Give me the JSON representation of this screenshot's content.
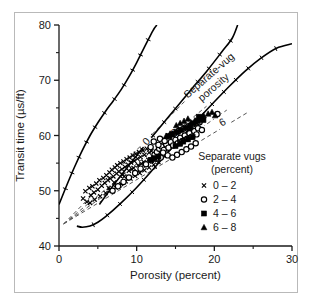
{
  "chart_data": {
    "type": "scatter",
    "title": "",
    "xlabel": "Porosity (percent)",
    "ylabel": "Transit time (µs/ft)",
    "xlim": [
      0,
      30
    ],
    "ylim": [
      40,
      80
    ],
    "xticks": [
      0,
      10,
      20,
      30
    ],
    "yticks": [
      40,
      50,
      60,
      70,
      80
    ],
    "xtick_labels": [
      "0",
      "10",
      "20",
      "30"
    ],
    "ytick_labels": [
      "40",
      "50",
      "60",
      "70",
      "80"
    ],
    "yminor_ticks": [
      45,
      55,
      65,
      75
    ],
    "xminor_ticks": [
      5,
      15,
      25
    ],
    "grid": false,
    "annotation": "Separate-vug porosity",
    "annotation_line1": "Separate-vug",
    "annotation_line2": "porosity",
    "contour_labels": [
      "0",
      "2",
      "4",
      "6"
    ],
    "legend": {
      "title_line1": "Separate vugs",
      "title_line2": "(percent)",
      "position": "lower-right",
      "entries": [
        {
          "marker": "cross",
          "label": "0 – 2"
        },
        {
          "marker": "circle",
          "label": "2 – 4"
        },
        {
          "marker": "square",
          "label": "4 – 6"
        },
        {
          "marker": "triangle",
          "label": "6 – 8"
        }
      ]
    },
    "boundary_curves": [
      {
        "name": "upper-left-bound",
        "points": [
          [
            0,
            47.5
          ],
          [
            1,
            51.0
          ],
          [
            2,
            54.3
          ],
          [
            3,
            57.3
          ],
          [
            4,
            60.0
          ],
          [
            5,
            62.3
          ],
          [
            6,
            64.4
          ],
          [
            7,
            66.3
          ],
          [
            8,
            68.3
          ],
          [
            9,
            70.6
          ],
          [
            10,
            73.2
          ],
          [
            11,
            76.0
          ],
          [
            12.1,
            79.0
          ],
          [
            12.6,
            80.0
          ]
        ]
      },
      {
        "name": "middle-bound",
        "points": [
          [
            5.2,
            47.5
          ],
          [
            7,
            51.0
          ],
          [
            9,
            54.6
          ],
          [
            11,
            58.1
          ],
          [
            13,
            61.5
          ],
          [
            15,
            64.9
          ],
          [
            17,
            68.3
          ],
          [
            19,
            71.6
          ],
          [
            21,
            75.2
          ],
          [
            22.3,
            77.6
          ],
          [
            23.0,
            80.0
          ]
        ]
      },
      {
        "name": "lower-right-bound",
        "points": [
          [
            2.3,
            43.6
          ],
          [
            3,
            43.4
          ],
          [
            4,
            43.6
          ],
          [
            5,
            44.3
          ],
          [
            6,
            45.3
          ],
          [
            8,
            47.8
          ],
          [
            10,
            50.6
          ],
          [
            12,
            53.7
          ],
          [
            14,
            56.9
          ],
          [
            16,
            60.0
          ],
          [
            18,
            63.1
          ],
          [
            20,
            66.1
          ],
          [
            22,
            69.0
          ],
          [
            24,
            71.7
          ],
          [
            26,
            74.0
          ],
          [
            28,
            75.8
          ],
          [
            30,
            76.6
          ]
        ]
      }
    ],
    "contour_lines": [
      {
        "label": "0",
        "points": [
          [
            0.6,
            44.0
          ],
          [
            16.2,
            66.2
          ]
        ],
        "label_at": [
          11.2,
          59.0
        ]
      },
      {
        "label": "2",
        "points": [
          [
            0.6,
            44.0
          ],
          [
            19.0,
            65.3
          ]
        ],
        "label_at": [
          14.8,
          60.6
        ]
      },
      {
        "label": "4",
        "points": [
          [
            0.6,
            44.0
          ],
          [
            21.6,
            64.6
          ]
        ],
        "label_at": [
          17.9,
          61.6
        ]
      },
      {
        "label": "6",
        "points": [
          [
            0.6,
            44.0
          ],
          [
            24.2,
            64.1
          ]
        ],
        "label_at": [
          21.0,
          62.5
        ]
      }
    ],
    "series": [
      {
        "name": "0 – 2",
        "marker": "cross",
        "points": [
          [
            3.1,
            48.6
          ],
          [
            3.4,
            49.9
          ],
          [
            3.6,
            48.0
          ],
          [
            3.9,
            50.5
          ],
          [
            4.1,
            49.2
          ],
          [
            4.3,
            50.8
          ],
          [
            4.5,
            49.7
          ],
          [
            4.8,
            51.3
          ],
          [
            5.0,
            50.2
          ],
          [
            5.2,
            51.9
          ],
          [
            5.5,
            50.9
          ],
          [
            5.7,
            52.3
          ],
          [
            5.9,
            51.4
          ],
          [
            6.1,
            52.8
          ],
          [
            6.3,
            51.9
          ],
          [
            6.5,
            53.3
          ],
          [
            6.6,
            52.2
          ],
          [
            6.8,
            53.8
          ],
          [
            7.0,
            52.6
          ],
          [
            7.2,
            54.2
          ],
          [
            7.4,
            53.1
          ],
          [
            7.5,
            54.6
          ],
          [
            7.7,
            53.5
          ],
          [
            7.9,
            55.0
          ],
          [
            8.1,
            53.9
          ],
          [
            8.3,
            55.3
          ],
          [
            8.5,
            54.3
          ],
          [
            8.7,
            55.7
          ],
          [
            8.9,
            54.7
          ],
          [
            9.1,
            56.0
          ],
          [
            9.3,
            55.1
          ],
          [
            9.5,
            56.4
          ],
          [
            9.7,
            55.4
          ],
          [
            9.9,
            56.7
          ],
          [
            10.1,
            55.8
          ],
          [
            10.3,
            57.0
          ],
          [
            10.5,
            56.1
          ],
          [
            10.8,
            57.3
          ],
          [
            11.0,
            56.5
          ],
          [
            11.3,
            57.6
          ],
          [
            11.6,
            56.9
          ],
          [
            11.9,
            57.2
          ],
          [
            4.0,
            47.8
          ],
          [
            4.6,
            48.4
          ],
          [
            5.3,
            49.0
          ],
          [
            6.0,
            49.6
          ],
          [
            6.7,
            50.1
          ],
          [
            7.3,
            50.6
          ],
          [
            8.0,
            51.2
          ],
          [
            8.6,
            51.7
          ],
          [
            9.2,
            52.2
          ],
          [
            9.8,
            52.7
          ],
          [
            10.4,
            53.2
          ],
          [
            11.0,
            53.7
          ],
          [
            11.6,
            54.2
          ],
          [
            12.2,
            54.7
          ],
          [
            12.8,
            55.2
          ],
          [
            7.8,
            51.0
          ],
          [
            8.4,
            52.6
          ],
          [
            9.0,
            53.6
          ],
          [
            9.6,
            54.1
          ],
          [
            10.2,
            54.6
          ],
          [
            10.9,
            55.2
          ],
          [
            11.5,
            55.6
          ],
          [
            12.1,
            56.0
          ],
          [
            6.4,
            50.5
          ],
          [
            7.1,
            51.5
          ],
          [
            8.2,
            52.9
          ],
          [
            9.4,
            53.9
          ],
          [
            10.6,
            54.9
          ]
        ]
      },
      {
        "name": "2 – 4",
        "marker": "circle",
        "points": [
          [
            6.9,
            50.0
          ],
          [
            7.6,
            50.8
          ],
          [
            8.3,
            51.6
          ],
          [
            9.0,
            52.4
          ],
          [
            9.8,
            53.2
          ],
          [
            10.5,
            54.0
          ],
          [
            11.2,
            54.8
          ],
          [
            11.9,
            55.5
          ],
          [
            12.3,
            56.5
          ],
          [
            12.6,
            57.0
          ],
          [
            12.9,
            57.6
          ],
          [
            13.2,
            58.0
          ],
          [
            13.5,
            57.4
          ],
          [
            13.8,
            58.4
          ],
          [
            14.1,
            57.8
          ],
          [
            14.4,
            58.8
          ],
          [
            14.7,
            58.2
          ],
          [
            15.0,
            59.2
          ],
          [
            15.3,
            58.6
          ],
          [
            15.6,
            59.6
          ],
          [
            15.9,
            59.0
          ],
          [
            16.2,
            60.0
          ],
          [
            16.5,
            59.4
          ],
          [
            16.8,
            60.4
          ],
          [
            17.1,
            59.8
          ],
          [
            17.4,
            60.8
          ],
          [
            17.7,
            60.2
          ],
          [
            12.2,
            58.9
          ],
          [
            12.8,
            58.3
          ],
          [
            13.4,
            56.9
          ],
          [
            14.0,
            56.4
          ],
          [
            14.6,
            56.0
          ],
          [
            15.2,
            56.5
          ],
          [
            15.8,
            57.0
          ],
          [
            16.4,
            57.5
          ],
          [
            17.0,
            58.0
          ],
          [
            17.6,
            58.6
          ],
          [
            13.0,
            59.4
          ],
          [
            13.6,
            59.0
          ],
          [
            14.2,
            59.8
          ],
          [
            14.8,
            60.3
          ],
          [
            15.4,
            60.8
          ],
          [
            16.0,
            61.2
          ],
          [
            16.6,
            61.6
          ],
          [
            17.2,
            62.0
          ],
          [
            17.9,
            61.3
          ],
          [
            18.4,
            61.0
          ],
          [
            13.1,
            56.0
          ],
          [
            11.8,
            57.9
          ],
          [
            12.5,
            55.8
          ],
          [
            18.1,
            62.4
          ],
          [
            20.4,
            63.9
          ]
        ]
      },
      {
        "name": "4 – 6",
        "marker": "square",
        "points": [
          [
            11.8,
            55.6
          ],
          [
            12.3,
            55.9
          ],
          [
            12.8,
            56.2
          ],
          [
            14.1,
            59.9
          ],
          [
            14.6,
            60.2
          ],
          [
            15.2,
            60.6
          ],
          [
            15.7,
            61.0
          ],
          [
            16.3,
            61.4
          ],
          [
            16.9,
            61.8
          ],
          [
            17.4,
            62.2
          ],
          [
            17.9,
            62.6
          ],
          [
            18.3,
            63.0
          ],
          [
            16.0,
            58.9
          ],
          [
            16.6,
            59.3
          ],
          [
            17.2,
            59.7
          ],
          [
            15.0,
            58.1
          ],
          [
            15.6,
            58.5
          ],
          [
            18.0,
            63.4
          ],
          [
            18.6,
            62.8
          ]
        ]
      },
      {
        "name": "6 – 8",
        "marker": "triangle",
        "points": [
          [
            13.8,
            59.9
          ],
          [
            14.3,
            60.3
          ],
          [
            15.6,
            62.2
          ],
          [
            16.1,
            62.6
          ],
          [
            16.6,
            63.0
          ],
          [
            17.0,
            62.3
          ],
          [
            17.5,
            62.7
          ],
          [
            19.2,
            63.9
          ],
          [
            19.7,
            64.2
          ],
          [
            20.1,
            63.6
          ],
          [
            18.1,
            63.2
          ],
          [
            18.6,
            63.6
          ],
          [
            15.1,
            61.8
          ],
          [
            16.9,
            61.4
          ]
        ]
      }
    ]
  }
}
